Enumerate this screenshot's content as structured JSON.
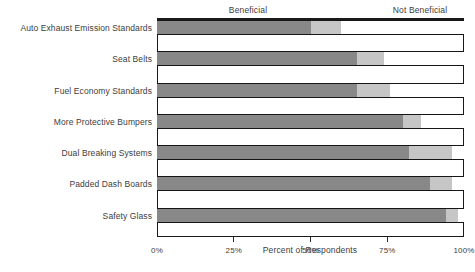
{
  "header": {
    "left_group_label": "Beneficial",
    "right_group_label": "Not Beneficial"
  },
  "axis": {
    "title": "Percent of Respondents",
    "ticks": [
      "0%",
      "25%",
      "50%",
      "75%",
      "100%"
    ]
  },
  "categories": [
    "Auto Exhaust Emission Standards",
    "Seat Belts",
    "Fuel Economy Standards",
    "More Protective Bumpers",
    "Dual Breaking Systems",
    "Padded Dash Boards",
    "Safety Glass"
  ],
  "chart_data": {
    "type": "bar",
    "orientation": "horizontal",
    "stacked": true,
    "title": "",
    "subtitle": "",
    "xlabel": "Percent of Respondents",
    "ylabel": "",
    "xlim": [
      0,
      100
    ],
    "xticks": [
      0,
      25,
      50,
      75,
      100
    ],
    "xticklabels": [
      "0%",
      "25%",
      "50%",
      "75%",
      "100%"
    ],
    "grid": false,
    "legend": "none",
    "annotations": [
      "Beneficial",
      "Not Beneficial"
    ],
    "categories": [
      "Auto Exhaust Emission Standards",
      "Seat Belts",
      "Fuel Economy Standards",
      "More Protective Bumpers",
      "Dual Breaking Systems",
      "Padded Dash Boards",
      "Safety Glass"
    ],
    "series": [
      {
        "name": "Beneficial",
        "color": "#888888",
        "values": [
          50,
          65,
          65,
          80,
          82,
          89,
          94
        ]
      },
      {
        "name": "No Opinion",
        "color": "#c6c6c6",
        "values": [
          10,
          9,
          11,
          6,
          14,
          7,
          4
        ]
      },
      {
        "name": "Not Beneficial",
        "color": "#ffffff",
        "values": [
          40,
          26,
          24,
          14,
          4,
          4,
          2
        ]
      }
    ],
    "cumulative_boundaries_percent": [
      [
        50,
        60
      ],
      [
        65,
        74
      ],
      [
        65,
        76
      ],
      [
        80,
        86
      ],
      [
        82,
        96
      ],
      [
        89,
        96
      ],
      [
        94,
        98
      ]
    ]
  },
  "colors": {
    "beneficial": "#888888",
    "middle": "#c6c6c6",
    "not_beneficial": "#ffffff",
    "frame": "#1a1a1a",
    "text": "#3d3d3d",
    "background": "#ffffff"
  }
}
